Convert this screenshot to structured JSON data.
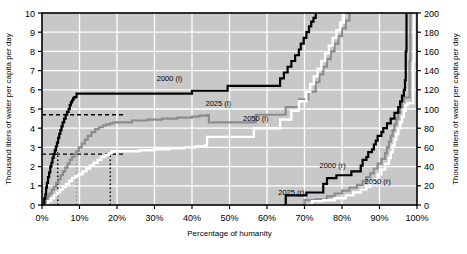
{
  "chart_data": {
    "type": "line",
    "title": "",
    "subtitle": "",
    "xlabel": "Percentage of humanity",
    "ylabel": "Thousand liters of water per capita per day",
    "ylabel_right": "Thousand liters of water per capita per day",
    "xlim": [
      0,
      100
    ],
    "ylim": [
      0,
      10
    ],
    "ylim_right": [
      0,
      200
    ],
    "grid": true,
    "legend_position": "inline-annotations",
    "plot_background": "#c8c8c8",
    "xticks": [
      "0%",
      "10%",
      "20%",
      "30%",
      "40%",
      "50%",
      "60%",
      "70%",
      "80%",
      "90%",
      "100%"
    ],
    "xtick_values": [
      0,
      10,
      20,
      30,
      40,
      50,
      60,
      70,
      80,
      90,
      100
    ],
    "yticks_left": [
      "0",
      "1",
      "2",
      "3",
      "4",
      "5",
      "6",
      "7",
      "8",
      "9",
      "10"
    ],
    "ytick_values_left": [
      0,
      1,
      2,
      3,
      4,
      5,
      6,
      7,
      8,
      9,
      10
    ],
    "yticks_right": [
      "0",
      "20",
      "40",
      "60",
      "80",
      "100",
      "120",
      "140",
      "160",
      "180",
      "200"
    ],
    "ytick_values_right": [
      0,
      20,
      40,
      60,
      80,
      100,
      120,
      140,
      160,
      180,
      200
    ],
    "annotations": [
      {
        "text": "2000 (l)",
        "x": 34,
        "y": 6.45,
        "color": "#000000"
      },
      {
        "text": "2025 (l)",
        "x": 47,
        "y": 5.15,
        "color": "#000000"
      },
      {
        "text": "2050 (l)",
        "x": 57,
        "y": 4.35,
        "color": "#000000"
      },
      {
        "text": "2000 (r)",
        "x": 77.5,
        "y": 1.95,
        "color": "#000000"
      },
      {
        "text": "2025 (r)",
        "x": 66.5,
        "y": 0.52,
        "color": "#000000"
      },
      {
        "text": "2050 (r)",
        "x": 89.5,
        "y": 1.1,
        "color": "#000000"
      }
    ],
    "reference_lines": [
      {
        "type": "horizontal",
        "value": 4.7,
        "axis": "left",
        "style": "dashed",
        "color": "#000000"
      },
      {
        "type": "horizontal",
        "value": 2.65,
        "axis": "left",
        "style": "dashed",
        "color": "#000000"
      },
      {
        "type": "vertical",
        "value": 4.2,
        "style": "dotted",
        "color": "#000000"
      },
      {
        "type": "vertical",
        "value": 9.2,
        "style": "dotted",
        "color": "#9a9a9a"
      },
      {
        "type": "vertical",
        "value": 18.2,
        "style": "dotted",
        "color": "#000000"
      }
    ],
    "series": [
      {
        "name": "2000 (l)",
        "axis": "left",
        "color": "#000000",
        "linewidth": 2.2,
        "points": [
          [
            0.4,
            0.0
          ],
          [
            0.6,
            0.35
          ],
          [
            0.9,
            0.55
          ],
          [
            1.1,
            0.9
          ],
          [
            1.3,
            1.15
          ],
          [
            1.6,
            1.45
          ],
          [
            1.9,
            1.7
          ],
          [
            2.2,
            2.0
          ],
          [
            2.5,
            2.2
          ],
          [
            2.8,
            2.45
          ],
          [
            3.1,
            2.65
          ],
          [
            3.4,
            2.85
          ],
          [
            3.7,
            3.05
          ],
          [
            4.0,
            3.25
          ],
          [
            4.3,
            3.5
          ],
          [
            4.6,
            3.7
          ],
          [
            4.9,
            3.9
          ],
          [
            5.2,
            4.1
          ],
          [
            5.5,
            4.3
          ],
          [
            5.9,
            4.5
          ],
          [
            6.3,
            4.7
          ],
          [
            6.7,
            4.85
          ],
          [
            7.1,
            5.0
          ],
          [
            7.4,
            5.2
          ],
          [
            7.7,
            5.35
          ],
          [
            8.0,
            5.45
          ],
          [
            8.3,
            5.55
          ],
          [
            8.6,
            5.62
          ],
          [
            9.2,
            5.8
          ],
          [
            39.5,
            5.8
          ],
          [
            40.0,
            5.95
          ],
          [
            49.0,
            5.95
          ],
          [
            49.5,
            6.2
          ],
          [
            63.0,
            6.2
          ],
          [
            63.5,
            6.6
          ],
          [
            64.5,
            6.9
          ],
          [
            65.5,
            7.2
          ],
          [
            66.5,
            7.5
          ],
          [
            67.5,
            7.8
          ],
          [
            68.5,
            8.1
          ],
          [
            69.0,
            8.4
          ],
          [
            69.8,
            8.7
          ],
          [
            70.5,
            9.0
          ],
          [
            71.2,
            9.3
          ],
          [
            71.8,
            9.55
          ],
          [
            72.4,
            9.75
          ],
          [
            73.0,
            10.0
          ]
        ]
      },
      {
        "name": "2025 (l)",
        "axis": "left",
        "color": "#8c8c8c",
        "linewidth": 2.2,
        "points": [
          [
            0.5,
            0.0
          ],
          [
            1.0,
            0.25
          ],
          [
            1.5,
            0.45
          ],
          [
            2.0,
            0.6
          ],
          [
            2.6,
            0.8
          ],
          [
            3.2,
            0.95
          ],
          [
            3.8,
            1.15
          ],
          [
            4.4,
            1.35
          ],
          [
            5.0,
            1.55
          ],
          [
            5.6,
            1.75
          ],
          [
            6.2,
            1.95
          ],
          [
            6.8,
            2.15
          ],
          [
            7.4,
            2.35
          ],
          [
            8.0,
            2.5
          ],
          [
            8.6,
            2.65
          ],
          [
            9.2,
            2.8
          ],
          [
            9.8,
            3.0
          ],
          [
            10.6,
            3.2
          ],
          [
            11.4,
            3.4
          ],
          [
            12.2,
            3.6
          ],
          [
            13.2,
            3.8
          ],
          [
            14.2,
            3.95
          ],
          [
            15.2,
            4.05
          ],
          [
            16.2,
            4.15
          ],
          [
            17.2,
            4.2
          ],
          [
            18.2,
            4.25
          ],
          [
            19.0,
            4.3
          ],
          [
            22.0,
            4.3
          ],
          [
            24.0,
            4.4
          ],
          [
            28.0,
            4.45
          ],
          [
            32.0,
            4.5
          ],
          [
            36.0,
            4.55
          ],
          [
            40.0,
            4.6
          ],
          [
            42.0,
            4.65
          ],
          [
            44.0,
            4.68
          ],
          [
            44.5,
            4.3
          ],
          [
            56.5,
            4.3
          ],
          [
            57.0,
            4.7
          ],
          [
            64.5,
            4.7
          ],
          [
            65.0,
            5.1
          ],
          [
            68.0,
            5.1
          ],
          [
            68.5,
            5.5
          ],
          [
            70.5,
            5.5
          ],
          [
            71.0,
            5.9
          ],
          [
            72.5,
            5.9
          ],
          [
            73.0,
            6.4
          ],
          [
            74.0,
            6.8
          ],
          [
            75.0,
            7.2
          ],
          [
            76.0,
            7.6
          ],
          [
            77.0,
            8.0
          ],
          [
            78.0,
            8.4
          ],
          [
            79.0,
            8.8
          ],
          [
            80.0,
            9.2
          ],
          [
            81.0,
            9.6
          ],
          [
            82.0,
            10.0
          ]
        ]
      },
      {
        "name": "2050 (l)",
        "axis": "left",
        "color": "#ffffff",
        "linewidth": 2.4,
        "points": [
          [
            0.8,
            0.0
          ],
          [
            1.6,
            0.2
          ],
          [
            2.4,
            0.35
          ],
          [
            3.2,
            0.5
          ],
          [
            4.0,
            0.65
          ],
          [
            4.8,
            0.8
          ],
          [
            5.6,
            0.95
          ],
          [
            6.4,
            1.1
          ],
          [
            7.2,
            1.25
          ],
          [
            8.0,
            1.4
          ],
          [
            8.8,
            1.5
          ],
          [
            9.8,
            1.6
          ],
          [
            10.8,
            1.75
          ],
          [
            11.8,
            1.9
          ],
          [
            12.8,
            2.05
          ],
          [
            13.8,
            2.2
          ],
          [
            14.8,
            2.35
          ],
          [
            15.8,
            2.5
          ],
          [
            16.8,
            2.6
          ],
          [
            17.8,
            2.7
          ],
          [
            18.6,
            2.8
          ],
          [
            22.0,
            2.8
          ],
          [
            26.0,
            2.85
          ],
          [
            30.0,
            2.9
          ],
          [
            34.0,
            2.95
          ],
          [
            38.0,
            3.0
          ],
          [
            41.0,
            3.05
          ],
          [
            43.5,
            3.1
          ],
          [
            44.0,
            3.55
          ],
          [
            56.0,
            3.55
          ],
          [
            56.5,
            4.0
          ],
          [
            63.0,
            4.0
          ],
          [
            63.5,
            4.45
          ],
          [
            66.0,
            4.45
          ],
          [
            66.5,
            4.9
          ],
          [
            68.0,
            4.9
          ],
          [
            68.5,
            5.4
          ],
          [
            70.0,
            5.4
          ],
          [
            70.5,
            5.9
          ],
          [
            71.5,
            6.3
          ],
          [
            72.5,
            6.7
          ],
          [
            73.5,
            7.1
          ],
          [
            74.5,
            7.5
          ],
          [
            75.5,
            7.9
          ],
          [
            76.5,
            8.3
          ],
          [
            77.5,
            8.7
          ],
          [
            78.5,
            9.1
          ],
          [
            79.5,
            9.5
          ],
          [
            80.5,
            10.0
          ]
        ]
      },
      {
        "name": "2000 (r)",
        "axis": "right",
        "color": "#000000",
        "linewidth": 2.2,
        "points": [
          [
            64.5,
            0
          ],
          [
            65.0,
            10
          ],
          [
            70.0,
            10
          ],
          [
            70.5,
            13
          ],
          [
            74.5,
            13
          ],
          [
            75.0,
            22
          ],
          [
            76.0,
            28
          ],
          [
            78.0,
            28
          ],
          [
            78.5,
            31
          ],
          [
            82.0,
            31
          ],
          [
            82.5,
            35
          ],
          [
            84.5,
            35
          ],
          [
            85.0,
            41
          ],
          [
            85.5,
            47
          ],
          [
            86.5,
            50
          ],
          [
            87.0,
            55
          ],
          [
            88.0,
            58
          ],
          [
            88.5,
            63
          ],
          [
            89.0,
            67
          ],
          [
            89.5,
            72
          ],
          [
            90.5,
            76
          ],
          [
            91.0,
            80
          ],
          [
            92.0,
            85
          ],
          [
            93.0,
            90
          ],
          [
            94.0,
            96
          ],
          [
            95.0,
            102
          ],
          [
            95.5,
            108
          ],
          [
            96.0,
            114
          ],
          [
            96.5,
            120
          ],
          [
            96.8,
            130
          ],
          [
            97.0,
            160
          ],
          [
            97.2,
            200
          ]
        ]
      },
      {
        "name": "2025 (r)",
        "axis": "right",
        "color": "#8c8c8c",
        "linewidth": 2.2,
        "points": [
          [
            69.0,
            0
          ],
          [
            70.0,
            5
          ],
          [
            73.0,
            6
          ],
          [
            76.0,
            9
          ],
          [
            78.0,
            12
          ],
          [
            80.0,
            15
          ],
          [
            82.0,
            18
          ],
          [
            84.0,
            21
          ],
          [
            85.5,
            25
          ],
          [
            86.5,
            29
          ],
          [
            87.5,
            33
          ],
          [
            88.5,
            38
          ],
          [
            89.5,
            43
          ],
          [
            90.5,
            48
          ],
          [
            91.5,
            54
          ],
          [
            92.0,
            60
          ],
          [
            92.5,
            66
          ],
          [
            93.0,
            72
          ],
          [
            93.5,
            78
          ],
          [
            94.0,
            84
          ],
          [
            94.5,
            90
          ],
          [
            95.0,
            96
          ],
          [
            95.5,
            102
          ],
          [
            96.0,
            108
          ],
          [
            96.5,
            112
          ],
          [
            97.5,
            112
          ],
          [
            98.0,
            150
          ],
          [
            98.2,
            200
          ]
        ]
      },
      {
        "name": "2050 (r)",
        "axis": "right",
        "color": "#ffffff",
        "linewidth": 2.4,
        "points": [
          [
            70.5,
            0
          ],
          [
            72.0,
            4
          ],
          [
            75.0,
            5
          ],
          [
            78.0,
            7
          ],
          [
            81.0,
            10
          ],
          [
            83.0,
            13
          ],
          [
            85.0,
            16
          ],
          [
            86.5,
            19
          ],
          [
            87.5,
            23
          ],
          [
            88.5,
            27
          ],
          [
            89.5,
            32
          ],
          [
            90.5,
            37
          ],
          [
            91.5,
            43
          ],
          [
            92.5,
            49
          ],
          [
            93.0,
            55
          ],
          [
            93.5,
            62
          ],
          [
            94.0,
            68
          ],
          [
            94.5,
            74
          ],
          [
            95.0,
            80
          ],
          [
            95.5,
            86
          ],
          [
            96.0,
            92
          ],
          [
            96.5,
            98
          ],
          [
            97.0,
            104
          ],
          [
            97.5,
            106
          ],
          [
            98.5,
            106
          ],
          [
            99.0,
            150
          ],
          [
            99.2,
            200
          ]
        ]
      }
    ]
  }
}
